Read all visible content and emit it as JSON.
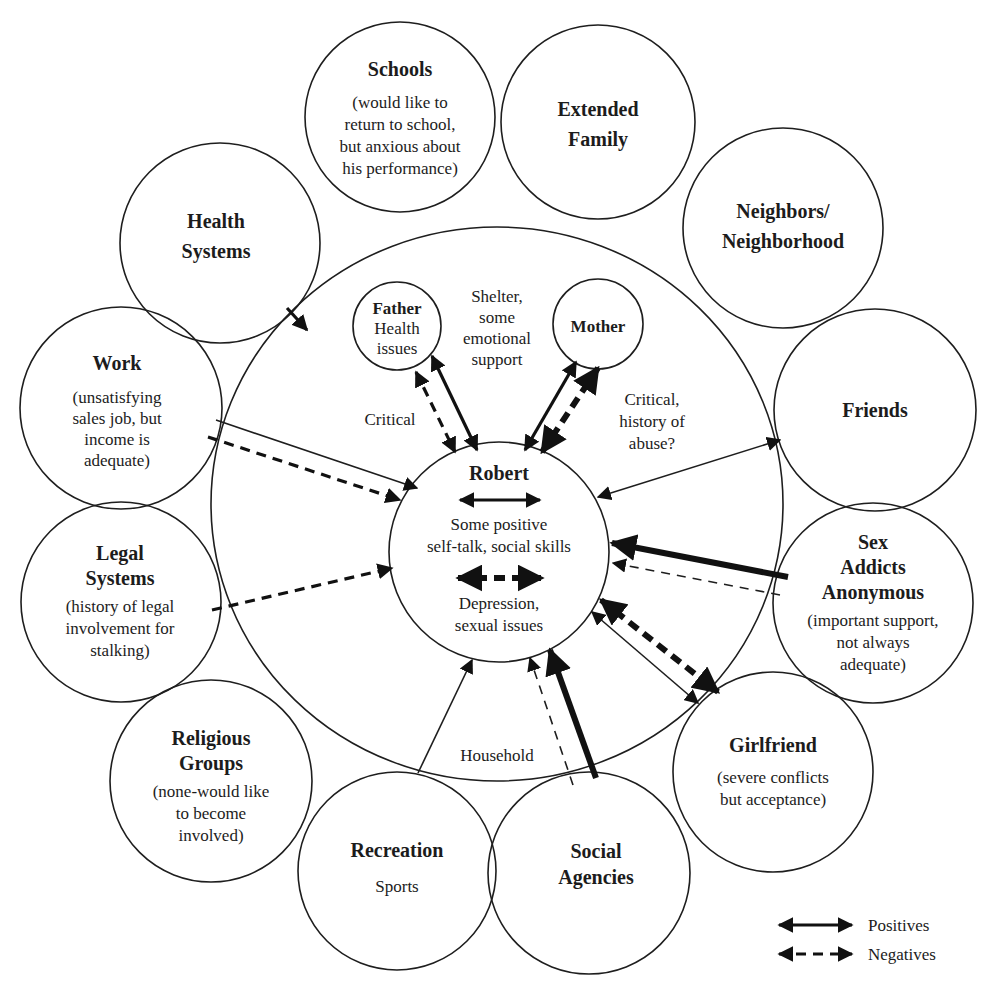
{
  "diagram": {
    "type": "ecomap",
    "focus": {
      "name": "Robert",
      "positive_note": "Some positive self-talk, social skills",
      "positive_lines": [
        "Some positive",
        "self-talk, social skills"
      ],
      "negative_note": "Depression, sexual issues",
      "negative_lines": [
        "Depression,",
        "sexual issues"
      ]
    },
    "household": {
      "label": "Household",
      "father": {
        "title": "Father",
        "lines": [
          "Health",
          "issues"
        ]
      },
      "mother": {
        "title": "Mother"
      },
      "father_relation_positive_lines": [
        "Shelter,",
        "some",
        "emotional",
        "support"
      ],
      "father_relation_negative": "Critical",
      "mother_relation_negative_lines": [
        "Critical,",
        "history of",
        "abuse?"
      ]
    },
    "systems": [
      {
        "id": "schools",
        "title_lines": [
          "Schools"
        ],
        "note_lines": [
          "(would like to",
          "return to school,",
          "but anxious about",
          "his performance)"
        ]
      },
      {
        "id": "extended-family",
        "title_lines": [
          "Extended",
          "Family"
        ],
        "note_lines": []
      },
      {
        "id": "neighbors",
        "title_lines": [
          "Neighbors/",
          "Neighborhood"
        ],
        "note_lines": []
      },
      {
        "id": "health-systems",
        "title_lines": [
          "Health",
          "Systems"
        ],
        "note_lines": []
      },
      {
        "id": "work",
        "title_lines": [
          "Work"
        ],
        "note_lines": [
          "(unsatisfying",
          "sales job, but",
          "income is",
          "adequate)"
        ]
      },
      {
        "id": "friends",
        "title_lines": [
          "Friends"
        ],
        "note_lines": []
      },
      {
        "id": "legal-systems",
        "title_lines": [
          "Legal",
          "Systems"
        ],
        "note_lines": [
          "(history of legal",
          "involvement for",
          "stalking)"
        ]
      },
      {
        "id": "sex-addicts-anonymous",
        "title_lines": [
          "Sex",
          "Addicts",
          "Anonymous"
        ],
        "note_lines": [
          "(important support,",
          "not always",
          "adequate)"
        ]
      },
      {
        "id": "religious-groups",
        "title_lines": [
          "Religious",
          "Groups"
        ],
        "note_lines": [
          "(none-would like",
          "to become",
          "involved)"
        ]
      },
      {
        "id": "girlfriend",
        "title_lines": [
          "Girlfriend"
        ],
        "note_lines": [
          "(severe conflicts",
          "but acceptance)"
        ]
      },
      {
        "id": "recreation",
        "title_lines": [
          "Recreation"
        ],
        "note_lines": [
          "Sports"
        ]
      },
      {
        "id": "social-agencies",
        "title_lines": [
          "Social",
          "Agencies"
        ],
        "note_lines": []
      }
    ],
    "legend": {
      "positives": "Positives",
      "negatives": "Negatives"
    }
  }
}
